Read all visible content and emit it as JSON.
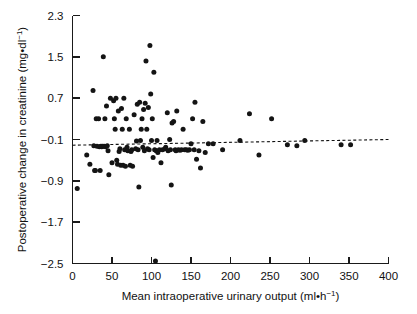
{
  "chart_data": {
    "type": "scatter",
    "title": "",
    "xlabel": "Mean intraoperative urinary output (ml·h⁻¹)",
    "ylabel": "Postoperative change in creatinine (mg·dl⁻¹)",
    "xlabel_text": "Mean intraoperative urinary output (ml•h",
    "xlabel_exp": "−1",
    "xlabel_tail": ")",
    "ylabel_text": "Postoperative change in creatinine (mg•dl",
    "ylabel_exp": "−1",
    "ylabel_tail": ")",
    "xlim": [
      0,
      400
    ],
    "ylim": [
      -2.5,
      2.3
    ],
    "xticks": [
      0,
      50,
      100,
      150,
      200,
      250,
      300,
      350,
      400
    ],
    "yticks": [
      -2.5,
      -1.7,
      -0.9,
      -0.1,
      0.7,
      1.5,
      2.3
    ],
    "xticklabels": [
      "0",
      "50",
      "100",
      "150",
      "200",
      "250",
      "300",
      "350",
      "400"
    ],
    "yticklabels": [
      "−2.5",
      "−1.7",
      "−0.9",
      "−0.1",
      "0.7",
      "1.5",
      "2.3"
    ],
    "grid": false,
    "legend": "none",
    "marker": "filled-circle",
    "marker_color": "#141414",
    "marker_size_px": 4.4,
    "axis_color": "#1a1a1a",
    "regression_line": {
      "style": "dashed",
      "color": "#111111",
      "x": [
        0,
        400
      ],
      "y": [
        -0.21,
        -0.1
      ],
      "note": "near-horizontal dashed trend line slightly below -0.1"
    },
    "n_points": 118,
    "points": [
      [
        6,
        -1.05
      ],
      [
        18,
        -0.4
      ],
      [
        22,
        -0.58
      ],
      [
        26,
        0.85
      ],
      [
        27,
        -0.22
      ],
      [
        28,
        -0.7
      ],
      [
        29,
        -0.7
      ],
      [
        30,
        0.3
      ],
      [
        31,
        -0.23
      ],
      [
        33,
        0.3
      ],
      [
        34,
        -0.24
      ],
      [
        35,
        -0.7
      ],
      [
        36,
        -0.23
      ],
      [
        37,
        -0.24
      ],
      [
        38,
        -0.23
      ],
      [
        39,
        1.5
      ],
      [
        40,
        -0.23
      ],
      [
        41,
        0.3
      ],
      [
        42,
        -0.24
      ],
      [
        43,
        0.55
      ],
      [
        44,
        -0.22
      ],
      [
        45,
        -0.32
      ],
      [
        46,
        -0.78
      ],
      [
        48,
        0.7
      ],
      [
        50,
        -0.55
      ],
      [
        52,
        0.65
      ],
      [
        53,
        0.3
      ],
      [
        54,
        0.1
      ],
      [
        55,
        0.7
      ],
      [
        56,
        -0.5
      ],
      [
        57,
        -0.58
      ],
      [
        58,
        0.45
      ],
      [
        59,
        -0.33
      ],
      [
        60,
        -0.28
      ],
      [
        61,
        -0.6
      ],
      [
        62,
        0.5
      ],
      [
        63,
        0.1
      ],
      [
        64,
        -0.6
      ],
      [
        65,
        0.7
      ],
      [
        66,
        -0.3
      ],
      [
        67,
        -0.62
      ],
      [
        68,
        0.3
      ],
      [
        69,
        -0.25
      ],
      [
        70,
        -0.32
      ],
      [
        72,
        0.1
      ],
      [
        73,
        -0.6
      ],
      [
        74,
        -0.33
      ],
      [
        75,
        -0.3
      ],
      [
        76,
        -0.62
      ],
      [
        78,
        0.38
      ],
      [
        80,
        -0.28
      ],
      [
        81,
        -0.13
      ],
      [
        82,
        0.58
      ],
      [
        83,
        -0.3
      ],
      [
        84,
        -1.02
      ],
      [
        85,
        0.62
      ],
      [
        86,
        -0.12
      ],
      [
        87,
        0.1
      ],
      [
        88,
        0.3
      ],
      [
        89,
        -0.25
      ],
      [
        90,
        0.48
      ],
      [
        91,
        -0.32
      ],
      [
        92,
        0.6
      ],
      [
        93,
        1.42
      ],
      [
        94,
        0.1
      ],
      [
        95,
        -0.28
      ],
      [
        96,
        0.52
      ],
      [
        97,
        -0.3
      ],
      [
        98,
        1.72
      ],
      [
        99,
        0.78
      ],
      [
        100,
        -0.12
      ],
      [
        101,
        0.3
      ],
      [
        102,
        -0.45
      ],
      [
        103,
        1.2
      ],
      [
        104,
        -0.3
      ],
      [
        105,
        -2.45
      ],
      [
        106,
        -0.32
      ],
      [
        107,
        -0.12
      ],
      [
        108,
        -0.35
      ],
      [
        110,
        -0.3
      ],
      [
        112,
        -0.55
      ],
      [
        114,
        -0.3
      ],
      [
        117,
        -0.28
      ],
      [
        118,
        -0.25
      ],
      [
        120,
        0.42
      ],
      [
        121,
        -0.32
      ],
      [
        123,
        -0.1
      ],
      [
        124,
        -0.3
      ],
      [
        125,
        -0.98
      ],
      [
        126,
        0.22
      ],
      [
        128,
        0.25
      ],
      [
        130,
        -0.3
      ],
      [
        131,
        -0.32
      ],
      [
        132,
        0.45
      ],
      [
        134,
        -0.3
      ],
      [
        136,
        -0.31
      ],
      [
        138,
        -0.3
      ],
      [
        140,
        0.1
      ],
      [
        142,
        -0.3
      ],
      [
        144,
        -0.3
      ],
      [
        146,
        -0.31
      ],
      [
        148,
        -0.3
      ],
      [
        150,
        -0.18
      ],
      [
        152,
        0.3
      ],
      [
        154,
        -0.3
      ],
      [
        155,
        0.62
      ],
      [
        157,
        -0.48
      ],
      [
        160,
        -0.32
      ],
      [
        162,
        -0.65
      ],
      [
        165,
        0.25
      ],
      [
        168,
        -0.35
      ],
      [
        172,
        -0.18
      ],
      [
        178,
        -0.18
      ],
      [
        190,
        -0.3
      ],
      [
        212,
        -0.12
      ],
      [
        224,
        0.4
      ],
      [
        236,
        -0.4
      ],
      [
        252,
        0.3
      ],
      [
        272,
        -0.2
      ],
      [
        284,
        -0.22
      ],
      [
        294,
        -0.12
      ],
      [
        340,
        -0.2
      ],
      [
        352,
        -0.2
      ]
    ]
  }
}
